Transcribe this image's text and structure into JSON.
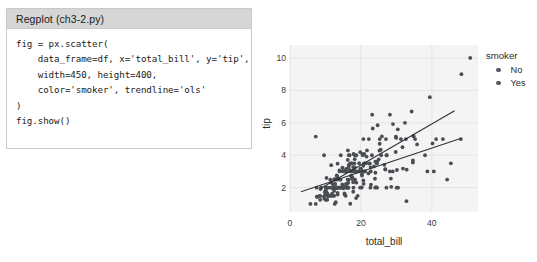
{
  "code_panel": {
    "caption": "Regplot (ch3-2.py)",
    "lines": [
      "fig = px.scatter(",
      "    data_frame=df, x='total_bill', y='tip',",
      "    width=450, height=400,",
      "    color='smoker', trendline='ols'",
      ")",
      "fig.show()"
    ]
  },
  "legend": {
    "title": "smoker",
    "entries": [
      {
        "label": "No",
        "color": "#55585c"
      },
      {
        "label": "Yes",
        "color": "#55585c"
      }
    ]
  },
  "colors": {
    "plot_background": "#f4f4f4",
    "gridline": "#e4e4e4",
    "marker": "#4a4d52",
    "trendline": "#2f3236",
    "panel_border": "#c9c9c9",
    "caption_background": "#d6d6d6"
  },
  "chart_data": {
    "type": "scatter",
    "title": "",
    "xlabel": "total_bill",
    "ylabel": "tip",
    "xlim": [
      0,
      53
    ],
    "ylim": [
      0.5,
      10.8
    ],
    "xticks": [
      0,
      20,
      40
    ],
    "yticks": [
      2,
      4,
      6,
      8,
      10
    ],
    "grid": true,
    "legend_position": "right",
    "legend_title": "smoker",
    "series": [
      {
        "name": "No",
        "color": "#4a4d52",
        "trendline": {
          "type": "ols",
          "x": [
            3.1,
            48.3
          ],
          "y": [
            1.75,
            5.05
          ]
        },
        "points": [
          [
            16.99,
            1.01
          ],
          [
            10.34,
            1.66
          ],
          [
            21.01,
            3.5
          ],
          [
            23.68,
            3.31
          ],
          [
            24.59,
            3.61
          ],
          [
            25.29,
            4.71
          ],
          [
            8.77,
            2.0
          ],
          [
            26.88,
            3.12
          ],
          [
            15.04,
            1.96
          ],
          [
            14.78,
            3.23
          ],
          [
            10.27,
            1.71
          ],
          [
            35.26,
            5.0
          ],
          [
            15.42,
            1.57
          ],
          [
            18.43,
            3.0
          ],
          [
            14.83,
            3.02
          ],
          [
            21.58,
            3.92
          ],
          [
            10.33,
            1.67
          ],
          [
            16.29,
            3.71
          ],
          [
            16.97,
            3.5
          ],
          [
            20.65,
            3.35
          ],
          [
            17.92,
            4.08
          ],
          [
            20.29,
            2.75
          ],
          [
            15.77,
            2.23
          ],
          [
            39.42,
            7.58
          ],
          [
            19.82,
            3.18
          ],
          [
            17.81,
            2.34
          ],
          [
            13.37,
            2.0
          ],
          [
            12.69,
            2.0
          ],
          [
            21.7,
            4.3
          ],
          [
            9.55,
            1.45
          ],
          [
            18.35,
            2.5
          ],
          [
            15.06,
            3.0
          ],
          [
            20.69,
            2.45
          ],
          [
            17.78,
            3.27
          ],
          [
            24.06,
            3.6
          ],
          [
            16.31,
            2.0
          ],
          [
            16.93,
            3.07
          ],
          [
            18.69,
            2.31
          ],
          [
            31.27,
            5.0
          ],
          [
            16.04,
            2.24
          ],
          [
            17.46,
            2.54
          ],
          [
            13.94,
            3.06
          ],
          [
            9.68,
            1.32
          ],
          [
            30.4,
            5.6
          ],
          [
            18.29,
            3.0
          ],
          [
            22.23,
            5.0
          ],
          [
            32.4,
            6.0
          ],
          [
            28.55,
            2.05
          ],
          [
            18.04,
            3.0
          ],
          [
            12.54,
            2.5
          ],
          [
            10.29,
            2.6
          ],
          [
            34.81,
            5.2
          ],
          [
            9.94,
            1.56
          ],
          [
            25.56,
            4.34
          ],
          [
            19.49,
            3.51
          ],
          [
            20.49,
            4.06
          ],
          [
            16.66,
            3.4
          ],
          [
            17.59,
            2.64
          ],
          [
            20.08,
            3.15
          ],
          [
            16.45,
            2.47
          ],
          [
            20.23,
            2.01
          ],
          [
            15.01,
            2.09
          ],
          [
            12.02,
            1.97
          ],
          [
            17.07,
            3.0
          ],
          [
            26.86,
            3.14
          ],
          [
            25.28,
            5.0
          ],
          [
            14.73,
            2.2
          ],
          [
            10.51,
            1.25
          ],
          [
            17.92,
            3.08
          ],
          [
            27.2,
            4.0
          ],
          [
            22.76,
            3.0
          ],
          [
            17.29,
            2.71
          ],
          [
            19.44,
            3.0
          ],
          [
            16.66,
            3.4
          ],
          [
            10.07,
            1.83
          ],
          [
            32.68,
            5.0
          ],
          [
            15.98,
            2.03
          ],
          [
            34.83,
            5.17
          ],
          [
            13.03,
            2.0
          ],
          [
            18.28,
            4.0
          ],
          [
            24.71,
            5.85
          ],
          [
            21.16,
            3.0
          ],
          [
            28.97,
            3.0
          ],
          [
            22.49,
            3.5
          ],
          [
            5.75,
            1.0
          ],
          [
            16.32,
            4.3
          ],
          [
            22.75,
            3.25
          ],
          [
            40.17,
            4.73
          ],
          [
            27.28,
            4.0
          ],
          [
            12.03,
            1.5
          ],
          [
            21.01,
            3.0
          ],
          [
            12.46,
            1.5
          ],
          [
            11.35,
            2.5
          ],
          [
            15.38,
            3.0
          ],
          [
            44.3,
            2.5
          ],
          [
            22.42,
            3.48
          ],
          [
            20.92,
            4.08
          ],
          [
            15.36,
            1.64
          ],
          [
            20.49,
            4.06
          ],
          [
            25.21,
            4.29
          ],
          [
            18.24,
            3.76
          ],
          [
            14.31,
            4.0
          ],
          [
            14.0,
            3.0
          ],
          [
            7.25,
            1.0
          ],
          [
            38.07,
            4.0
          ],
          [
            23.95,
            2.55
          ],
          [
            25.71,
            4.0
          ],
          [
            17.31,
            3.5
          ],
          [
            29.93,
            5.07
          ],
          [
            10.65,
            1.5
          ],
          [
            12.43,
            1.8
          ],
          [
            24.08,
            2.92
          ],
          [
            11.69,
            2.31
          ],
          [
            13.42,
            1.68
          ],
          [
            14.26,
            2.5
          ],
          [
            15.95,
            2.0
          ],
          [
            12.48,
            2.52
          ],
          [
            29.8,
            4.2
          ],
          [
            8.52,
            1.48
          ],
          [
            14.52,
            2.0
          ],
          [
            11.38,
            2.0
          ],
          [
            22.82,
            2.18
          ],
          [
            19.08,
            1.5
          ],
          [
            20.27,
            2.83
          ],
          [
            11.17,
            1.5
          ],
          [
            12.26,
            2.0
          ],
          [
            18.26,
            3.25
          ],
          [
            8.51,
            1.25
          ],
          [
            10.33,
            2.0
          ],
          [
            14.15,
            2.0
          ],
          [
            13.16,
            2.75
          ],
          [
            17.47,
            3.5
          ],
          [
            34.3,
            6.7
          ],
          [
            41.19,
            5.0
          ],
          [
            27.05,
            5.0
          ],
          [
            16.43,
            2.3
          ],
          [
            8.35,
            1.5
          ],
          [
            18.64,
            1.36
          ],
          [
            11.87,
            1.63
          ],
          [
            9.78,
            1.73
          ],
          [
            7.51,
            2.0
          ],
          [
            14.07,
            2.5
          ],
          [
            13.13,
            2.0
          ],
          [
            17.26,
            2.74
          ],
          [
            24.55,
            2.0
          ],
          [
            19.77,
            2.0
          ],
          [
            29.85,
            5.14
          ],
          [
            48.17,
            5.0
          ],
          [
            25.0,
            3.75
          ],
          [
            13.39,
            2.61
          ],
          [
            16.49,
            2.0
          ],
          [
            21.5,
            3.5
          ],
          [
            12.66,
            2.5
          ],
          [
            16.21,
            2.0
          ],
          [
            13.81,
            2.0
          ],
          [
            17.51,
            3.0
          ],
          [
            24.52,
            3.48
          ],
          [
            20.76,
            2.24
          ],
          [
            31.71,
            4.5
          ],
          [
            10.59,
            1.61
          ],
          [
            10.63,
            2.0
          ],
          [
            50.81,
            10.0
          ],
          [
            15.81,
            3.16
          ],
          [
            7.25,
            5.15
          ],
          [
            31.85,
            3.18
          ],
          [
            16.82,
            4.0
          ],
          [
            32.9,
            3.11
          ],
          [
            17.89,
            2.0
          ],
          [
            14.48,
            2.0
          ],
          [
            9.6,
            4.0
          ],
          [
            34.63,
            3.55
          ],
          [
            34.65,
            3.68
          ],
          [
            23.33,
            5.65
          ],
          [
            45.35,
            3.5
          ],
          [
            23.17,
            6.5
          ],
          [
            40.55,
            3.0
          ],
          [
            20.69,
            5.0
          ],
          [
            20.9,
            3.5
          ],
          [
            30.46,
            2.0
          ],
          [
            18.15,
            3.5
          ],
          [
            23.1,
            4.0
          ],
          [
            15.69,
            1.5
          ],
          [
            19.81,
            4.19
          ],
          [
            28.44,
            2.56
          ],
          [
            15.48,
            2.02
          ],
          [
            16.58,
            4.0
          ],
          [
            7.56,
            1.44
          ],
          [
            10.34,
            2.0
          ],
          [
            43.11,
            5.0
          ],
          [
            13.0,
            2.0
          ],
          [
            13.51,
            2.0
          ],
          [
            18.71,
            4.0
          ],
          [
            12.74,
            2.01
          ],
          [
            13.0,
            2.0
          ],
          [
            16.4,
            2.5
          ],
          [
            20.53,
            4.0
          ],
          [
            16.47,
            3.23
          ],
          [
            26.59,
            3.41
          ],
          [
            38.73,
            3.0
          ],
          [
            24.27,
            2.03
          ],
          [
            12.76,
            2.23
          ],
          [
            30.06,
            2.0
          ],
          [
            25.89,
            5.16
          ],
          [
            48.33,
            9.0
          ],
          [
            13.27,
            2.5
          ],
          [
            28.17,
            6.5
          ],
          [
            12.9,
            1.1
          ],
          [
            28.15,
            3.0
          ],
          [
            11.59,
            1.5
          ],
          [
            7.74,
            1.44
          ],
          [
            30.14,
            3.09
          ],
          [
            12.16,
            2.2
          ],
          [
            13.42,
            3.48
          ],
          [
            8.58,
            1.92
          ],
          [
            15.98,
            3.0
          ],
          [
            13.42,
            1.58
          ],
          [
            16.27,
            2.5
          ],
          [
            10.09,
            2.0
          ],
          [
            20.45,
            3.0
          ],
          [
            13.28,
            2.72
          ],
          [
            22.12,
            2.88
          ],
          [
            24.01,
            2.0
          ],
          [
            15.69,
            3.0
          ],
          [
            11.61,
            3.39
          ],
          [
            10.77,
            1.47
          ],
          [
            15.53,
            3.0
          ],
          [
            10.07,
            1.25
          ],
          [
            12.6,
            1.0
          ],
          [
            32.83,
            1.17
          ],
          [
            35.83,
            4.67
          ],
          [
            29.03,
            5.92
          ],
          [
            27.18,
            2.0
          ],
          [
            22.67,
            2.0
          ],
          [
            17.82,
            1.75
          ],
          [
            18.78,
            3.0
          ]
        ]
      },
      {
        "name": "Yes",
        "color": "#4a4d52",
        "trendline": {
          "type": "ols",
          "x": [
            8.6,
            46.4
          ],
          "y": [
            1.95,
            6.75
          ]
        },
        "points": []
      }
    ]
  }
}
